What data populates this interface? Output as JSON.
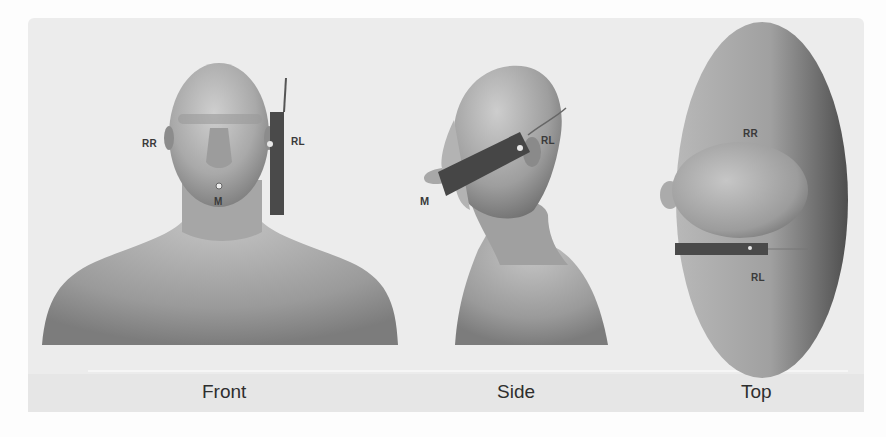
{
  "figure": {
    "views": [
      {
        "id": "front",
        "caption": "Front"
      },
      {
        "id": "side",
        "caption": "Side"
      },
      {
        "id": "top",
        "caption": "Top"
      }
    ],
    "markers": {
      "front": {
        "right_right": "RR",
        "right_left": "RL",
        "mouth": "M"
      },
      "side": {
        "right_left": "RL",
        "mouth": "M"
      },
      "top": {
        "right_right": "RR",
        "right_left": "RL"
      }
    },
    "colors": {
      "background": "#ececec",
      "skin_light": "#c9c9c9",
      "skin_dark": "#6e6e6e",
      "device": "#444444",
      "label": "#3a3a3a"
    }
  }
}
